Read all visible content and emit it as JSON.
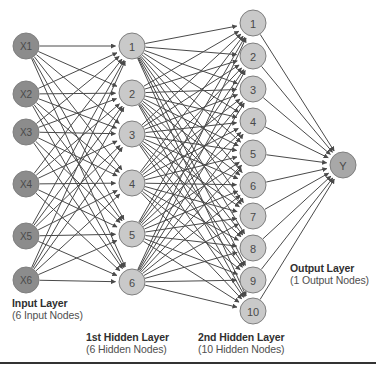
{
  "diagram": {
    "type": "neural-network",
    "background": "#ffffff",
    "colors": {
      "input_node_fill": "#8c8c8c",
      "hidden_node_fill": "#c9c9c9",
      "output_node_fill": "#a8a8a8",
      "node_stroke": "#7f7f7f",
      "edge_color": "#4a4a4a",
      "caption_title_color": "#2f2f2f",
      "caption_sub_color": "#4f4f4f",
      "rule_color": "#333333"
    },
    "layers": [
      {
        "id": "input",
        "title": "Input Layer",
        "subtitle": "(6 Input Nodes)",
        "node_count": 6,
        "cx": 26,
        "r": 13,
        "y_start": 46,
        "y_step": 48,
        "fill": "#8c8c8c",
        "nodes": [
          {
            "label": "X1",
            "cx": 26,
            "cy": 46
          },
          {
            "label": "X2",
            "cx": 26,
            "cy": 94
          },
          {
            "label": "X3",
            "cx": 26,
            "cy": 132
          },
          {
            "label": "X4",
            "cx": 26,
            "cy": 184
          },
          {
            "label": "X5",
            "cx": 26,
            "cy": 236
          },
          {
            "label": "X6",
            "cx": 26,
            "cy": 280
          }
        ]
      },
      {
        "id": "hidden1",
        "title": "1st Hidden Layer",
        "subtitle": "(6 Hidden Nodes)",
        "node_count": 6,
        "cx": 132,
        "r": 13,
        "fill": "#c9c9c9",
        "nodes": [
          {
            "label": "1",
            "cx": 132,
            "cy": 46
          },
          {
            "label": "2",
            "cx": 132,
            "cy": 93
          },
          {
            "label": "3",
            "cx": 132,
            "cy": 134
          },
          {
            "label": "4",
            "cx": 132,
            "cy": 183
          },
          {
            "label": "5",
            "cx": 132,
            "cy": 234
          },
          {
            "label": "6",
            "cx": 132,
            "cy": 282
          }
        ]
      },
      {
        "id": "hidden2",
        "title": "2nd Hidden Layer",
        "subtitle": "(10 Hidden Nodes)",
        "node_count": 10,
        "cx": 253,
        "r": 13,
        "fill": "#c9c9c9",
        "nodes": [
          {
            "label": "1",
            "cx": 253,
            "cy": 23
          },
          {
            "label": "2",
            "cx": 253,
            "cy": 56
          },
          {
            "label": "3",
            "cx": 253,
            "cy": 89
          },
          {
            "label": "4",
            "cx": 253,
            "cy": 121
          },
          {
            "label": "5",
            "cx": 253,
            "cy": 153
          },
          {
            "label": "6",
            "cx": 253,
            "cy": 185
          },
          {
            "label": "7",
            "cx": 253,
            "cy": 216
          },
          {
            "label": "8",
            "cx": 253,
            "cy": 248
          },
          {
            "label": "9",
            "cx": 253,
            "cy": 280
          },
          {
            "label": "10",
            "cx": 253,
            "cy": 311
          }
        ]
      },
      {
        "id": "output",
        "title": "Output Layer",
        "subtitle": "(1 Output Nodes)",
        "node_count": 1,
        "cx": 343,
        "r": 13,
        "fill": "#a8a8a8",
        "nodes": [
          {
            "label": "Y",
            "cx": 343,
            "cy": 165
          }
        ]
      }
    ],
    "connections": [
      {
        "from": "input",
        "to": "hidden1",
        "style": "fully-connected",
        "arrowheads": true
      },
      {
        "from": "hidden1",
        "to": "hidden2",
        "style": "fully-connected",
        "arrowheads": true
      },
      {
        "from": "hidden2",
        "to": "output",
        "style": "fully-connected",
        "arrowheads": true
      }
    ],
    "bottom_rule": true
  }
}
